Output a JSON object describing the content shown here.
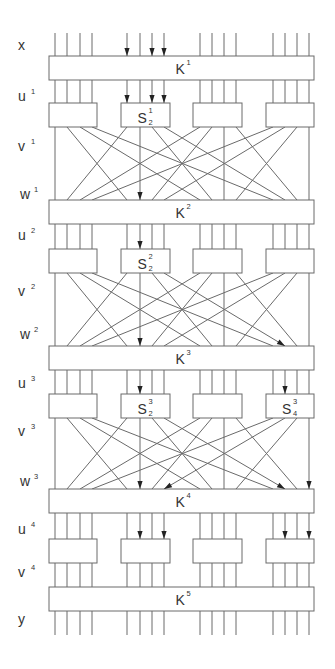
{
  "diagram": {
    "bits": 16,
    "row_labels": [
      {
        "id": "x",
        "base": "x",
        "sup": ""
      },
      {
        "id": "u1",
        "base": "u",
        "sup": "1"
      },
      {
        "id": "v1",
        "base": "v",
        "sup": "1"
      },
      {
        "id": "w1",
        "base": "w",
        "sup": "1"
      },
      {
        "id": "u2",
        "base": "u",
        "sup": "2"
      },
      {
        "id": "v2",
        "base": "v",
        "sup": "2"
      },
      {
        "id": "w2",
        "base": "w",
        "sup": "2"
      },
      {
        "id": "u3",
        "base": "u",
        "sup": "3"
      },
      {
        "id": "v3",
        "base": "v",
        "sup": "3"
      },
      {
        "id": "w3",
        "base": "w",
        "sup": "3"
      },
      {
        "id": "u4",
        "base": "u",
        "sup": "4"
      },
      {
        "id": "v4",
        "base": "v",
        "sup": "4"
      },
      {
        "id": "y",
        "base": "y",
        "sup": ""
      }
    ],
    "key_boxes": [
      {
        "base": "K",
        "sup": "1"
      },
      {
        "base": "K",
        "sup": "2"
      },
      {
        "base": "K",
        "sup": "3"
      },
      {
        "base": "K",
        "sup": "4"
      },
      {
        "base": "K",
        "sup": "5"
      }
    ],
    "sbox_rounds": [
      {
        "round": 1,
        "boxes": [
          {
            "base": "",
            "sup": "",
            "sub": ""
          },
          {
            "base": "S",
            "sup": "1",
            "sub": "2"
          },
          {
            "base": "",
            "sup": "",
            "sub": ""
          },
          {
            "base": "",
            "sup": "",
            "sub": ""
          }
        ]
      },
      {
        "round": 2,
        "boxes": [
          {
            "base": "",
            "sup": "",
            "sub": ""
          },
          {
            "base": "S",
            "sup": "2",
            "sub": "2"
          },
          {
            "base": "",
            "sup": "",
            "sub": ""
          },
          {
            "base": "",
            "sup": "",
            "sub": ""
          }
        ]
      },
      {
        "round": 3,
        "boxes": [
          {
            "base": "",
            "sup": "",
            "sub": ""
          },
          {
            "base": "S",
            "sup": "3",
            "sub": "2"
          },
          {
            "base": "",
            "sup": "",
            "sub": ""
          },
          {
            "base": "S",
            "sup": "3",
            "sub": "4"
          }
        ]
      },
      {
        "round": 4,
        "boxes": [
          {
            "base": "",
            "sup": "",
            "sub": ""
          },
          {
            "base": "",
            "sup": "",
            "sub": ""
          },
          {
            "base": "",
            "sup": "",
            "sub": ""
          },
          {
            "base": "",
            "sup": "",
            "sub": ""
          }
        ]
      }
    ],
    "permutation": [
      1,
      5,
      9,
      13,
      2,
      6,
      10,
      14,
      3,
      7,
      11,
      15,
      4,
      8,
      12,
      16
    ],
    "active_bits": {
      "x": [
        5,
        7,
        8
      ],
      "u": [
        [
          5,
          7,
          8
        ],
        [
          6
        ],
        [
          6,
          14
        ],
        [
          6,
          8,
          14,
          16
        ]
      ],
      "permutation_sources": [
        [
          6
        ],
        [
          6,
          8
        ],
        [
          6,
          8,
          14,
          16
        ]
      ]
    },
    "colors": {
      "wire": "#6a6a6a",
      "arrow": "#222222",
      "text": "#333333",
      "background": "#ffffff"
    }
  }
}
